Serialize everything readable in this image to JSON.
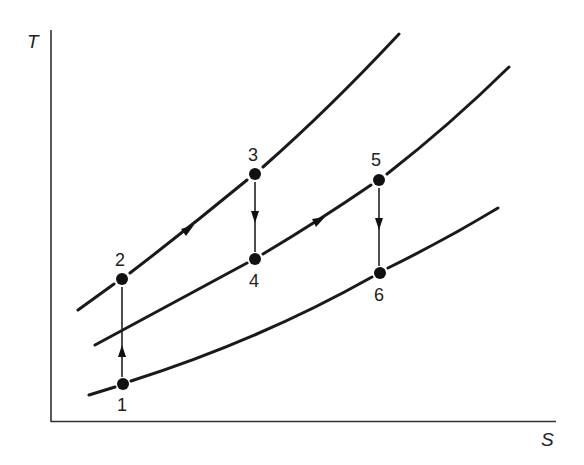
{
  "diagram": {
    "type": "T-s diagram",
    "axes": {
      "y_label": "T",
      "x_label": "S"
    },
    "curves": [
      {
        "name": "upper-isobar",
        "points": [
          [
            78,
            310
          ],
          [
            122,
            279
          ],
          [
            190,
            227
          ],
          [
            255,
            174
          ],
          [
            330,
            110
          ],
          [
            399,
            34
          ]
        ]
      },
      {
        "name": "middle-isobar",
        "points": [
          [
            95,
            345
          ],
          [
            122,
            330
          ],
          [
            190,
            295
          ],
          [
            255,
            259
          ],
          [
            318,
            221
          ],
          [
            379,
            180
          ],
          [
            445,
            130
          ],
          [
            509,
            67
          ]
        ]
      },
      {
        "name": "lower-isobar",
        "points": [
          [
            89,
            395
          ],
          [
            123,
            384
          ],
          [
            190,
            362
          ],
          [
            255,
            335
          ],
          [
            318,
            305
          ],
          [
            380,
            273
          ],
          [
            440,
            243
          ],
          [
            498,
            208
          ]
        ]
      }
    ],
    "states": [
      {
        "id": "1",
        "label": "1",
        "x": 123,
        "y": 384,
        "label_pos": "below"
      },
      {
        "id": "2",
        "label": "2",
        "x": 122,
        "y": 279,
        "label_pos": "above"
      },
      {
        "id": "3",
        "label": "3",
        "x": 255,
        "y": 174,
        "label_pos": "above"
      },
      {
        "id": "4",
        "label": "4",
        "x": 255,
        "y": 259,
        "label_pos": "below"
      },
      {
        "id": "5",
        "label": "5",
        "x": 379,
        "y": 180,
        "label_pos": "above"
      },
      {
        "id": "6",
        "label": "6",
        "x": 380,
        "y": 273,
        "label_pos": "below"
      }
    ],
    "processes": [
      {
        "from": "1",
        "to": "2",
        "kind": "vertical",
        "direction": "up"
      },
      {
        "from": "2",
        "to": "3",
        "kind": "along-curve",
        "direction": "right"
      },
      {
        "from": "3",
        "to": "4",
        "kind": "vertical",
        "direction": "down"
      },
      {
        "from": "4",
        "to": "5",
        "kind": "along-curve",
        "direction": "right"
      },
      {
        "from": "5",
        "to": "6",
        "kind": "vertical",
        "direction": "down"
      }
    ]
  }
}
